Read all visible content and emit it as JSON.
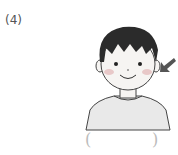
{
  "question": {
    "number": "(4)",
    "image": "boy-with-arrow-pointing-to-ear",
    "answer_box": {
      "open": "(",
      "close": ")",
      "value": ""
    }
  },
  "colors": {
    "hair": "#2b2b2b",
    "skin": "#f6f4f2",
    "cheek": "#e8c8c8",
    "shirt": "#e9e9e9",
    "outline": "#444444",
    "arrow": "#555555"
  }
}
